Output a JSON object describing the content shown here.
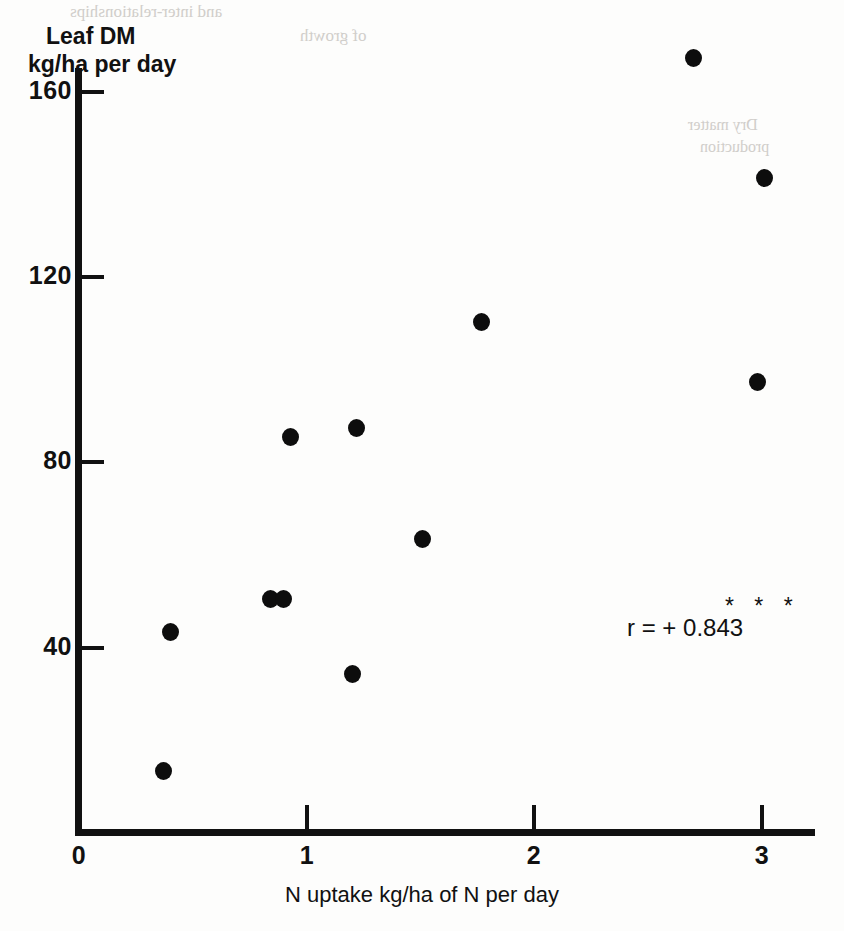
{
  "chart_data": {
    "type": "scatter",
    "title": "",
    "xlabel": "N uptake kg/ha of N per day",
    "ylabel_line1": "Leaf DM",
    "ylabel_line2": "kg/ha per day",
    "xlim": [
      0,
      3.25
    ],
    "ylim": [
      0,
      175
    ],
    "xticks": [
      "0",
      "1",
      "2",
      "3"
    ],
    "xtick_values": [
      0,
      1,
      2,
      3
    ],
    "yticks": [
      "40",
      "80",
      "120",
      "160"
    ],
    "ytick_values": [
      40,
      80,
      120,
      160
    ],
    "grid": false,
    "legend": false,
    "marker": "filled-circle",
    "marker_color": "#0d0d0d",
    "points": [
      {
        "x": 0.37,
        "y": 13
      },
      {
        "x": 0.4,
        "y": 43
      },
      {
        "x": 0.84,
        "y": 50
      },
      {
        "x": 0.9,
        "y": 50
      },
      {
        "x": 0.93,
        "y": 85
      },
      {
        "x": 1.2,
        "y": 34
      },
      {
        "x": 1.22,
        "y": 87
      },
      {
        "x": 1.51,
        "y": 63
      },
      {
        "x": 1.77,
        "y": 110
      },
      {
        "x": 2.7,
        "y": 167
      },
      {
        "x": 2.98,
        "y": 97
      },
      {
        "x": 3.01,
        "y": 141
      }
    ],
    "annotations": [
      {
        "name": "correlation",
        "text": "r = + 0.843",
        "significance": "* * *"
      }
    ]
  },
  "axes": {
    "y_title_line1": "Leaf DM",
    "y_title_line2": "kg/ha per day",
    "x_title": "N uptake kg/ha of N per day",
    "y_tick_labels": [
      "160",
      "120",
      "80",
      "40"
    ],
    "x_tick_labels": [
      "0",
      "1",
      "2",
      "3"
    ]
  },
  "annotation": {
    "correlation_text": "r = + 0.843",
    "significance_stars": "* * *"
  },
  "bleed_through": {
    "top_line_1": "and inter-relationships",
    "top_line_2": "of growth",
    "right_line_1": "Dry matter",
    "right_line_2": "production"
  }
}
